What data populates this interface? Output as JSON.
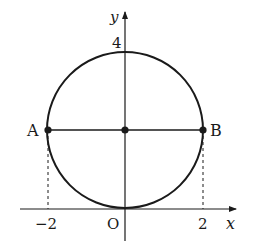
{
  "diagram": {
    "type": "coordinate-geometry",
    "axes": {
      "x_label": "x",
      "y_label": "y",
      "origin_label": "O"
    },
    "ticks": {
      "y_top": "4",
      "x_left": "−2",
      "x_right": "2"
    },
    "points": {
      "A": {
        "label": "A",
        "coords": [
          -2,
          2
        ]
      },
      "B": {
        "label": "B",
        "coords": [
          2,
          2
        ]
      },
      "center": {
        "label": "",
        "coords": [
          0,
          2
        ]
      }
    },
    "circle": {
      "center": [
        0,
        2
      ],
      "radius": 2
    },
    "colors": {
      "stroke": "#1a1a1a",
      "background": "#ffffff"
    }
  }
}
